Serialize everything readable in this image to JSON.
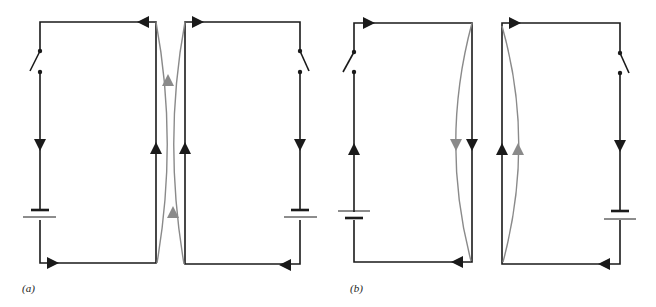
{
  "figure": {
    "colors": {
      "wire": "#1a1a1a",
      "field": "#8a8a8a",
      "background": "#ffffff"
    },
    "panels": [
      {
        "id": "a",
        "label": "(a)",
        "left_circuit_current": "clockwise at facing side: upward",
        "right_circuit_current": "upward at facing side",
        "note": "currents in facing wires parallel"
      },
      {
        "id": "b",
        "label": "(b)",
        "left_circuit_current": "downward at facing side",
        "right_circuit_current": "upward at facing side",
        "note": "currents in facing wires antiparallel"
      }
    ]
  }
}
